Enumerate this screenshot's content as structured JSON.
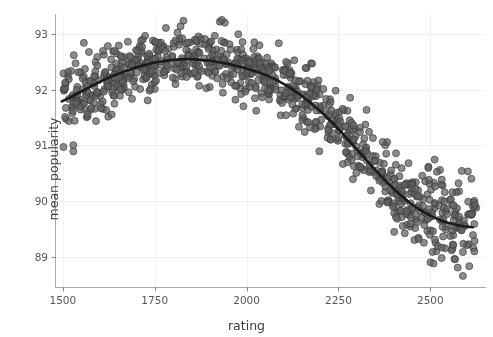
{
  "chart_data": {
    "type": "scatter",
    "title": "",
    "xlabel": "rating",
    "ylabel": "mean popularity",
    "xlim": [
      1480,
      2650
    ],
    "ylim": [
      88.45,
      93.35
    ],
    "xticks": [
      1500,
      1750,
      2000,
      2250,
      2500
    ],
    "yticks": [
      89,
      90,
      91,
      92,
      93
    ],
    "xtick_labels": [
      "1500",
      "1750",
      "2000",
      "2250",
      "2500"
    ],
    "ytick_labels": [
      "89",
      "90",
      "91",
      "92",
      "93"
    ],
    "grid": true,
    "grid_color": "#f0f0f0",
    "legend": "none",
    "point_color": "#5f5f5f",
    "point_edge_color": "#3a3a3a",
    "point_alpha": 0.72,
    "point_size": 7,
    "trend_color": "#1a1a1a",
    "trend_width": 2.6,
    "trend_note": "smoothed LOESS-style fit through the point cloud",
    "trend_points": [
      {
        "x": 1497,
        "y": 91.79
      },
      {
        "x": 1520,
        "y": 91.86
      },
      {
        "x": 1545,
        "y": 91.95
      },
      {
        "x": 1570,
        "y": 92.04
      },
      {
        "x": 1600,
        "y": 92.14
      },
      {
        "x": 1630,
        "y": 92.23
      },
      {
        "x": 1660,
        "y": 92.31
      },
      {
        "x": 1690,
        "y": 92.38
      },
      {
        "x": 1720,
        "y": 92.44
      },
      {
        "x": 1750,
        "y": 92.49
      },
      {
        "x": 1780,
        "y": 92.52
      },
      {
        "x": 1810,
        "y": 92.54
      },
      {
        "x": 1840,
        "y": 92.55
      },
      {
        "x": 1870,
        "y": 92.54
      },
      {
        "x": 1900,
        "y": 92.52
      },
      {
        "x": 1930,
        "y": 92.49
      },
      {
        "x": 1960,
        "y": 92.45
      },
      {
        "x": 1990,
        "y": 92.4
      },
      {
        "x": 2020,
        "y": 92.34
      },
      {
        "x": 2050,
        "y": 92.27
      },
      {
        "x": 2080,
        "y": 92.18
      },
      {
        "x": 2110,
        "y": 92.07
      },
      {
        "x": 2140,
        "y": 91.94
      },
      {
        "x": 2170,
        "y": 91.79
      },
      {
        "x": 2200,
        "y": 91.62
      },
      {
        "x": 2230,
        "y": 91.43
      },
      {
        "x": 2260,
        "y": 91.22
      },
      {
        "x": 2290,
        "y": 91.0
      },
      {
        "x": 2320,
        "y": 90.78
      },
      {
        "x": 2350,
        "y": 90.56
      },
      {
        "x": 2380,
        "y": 90.35
      },
      {
        "x": 2410,
        "y": 90.16
      },
      {
        "x": 2440,
        "y": 89.99
      },
      {
        "x": 2470,
        "y": 89.85
      },
      {
        "x": 2500,
        "y": 89.74
      },
      {
        "x": 2530,
        "y": 89.65
      },
      {
        "x": 2560,
        "y": 89.59
      },
      {
        "x": 2590,
        "y": 89.55
      },
      {
        "x": 2615,
        "y": 89.53
      }
    ],
    "scatter_description": "Dense cloud of ~900 semi-transparent dark-grey markers straddling the fitted curve; spread is widest near rating 2300-2620 where points fan from about 88.6 to 90.9, and tightest near rating 1700-1900 around 92.2-93.1.",
    "scatter_band": [
      {
        "x": 1500,
        "spread": 0.42
      },
      {
        "x": 1600,
        "spread": 0.3
      },
      {
        "x": 1750,
        "spread": 0.28
      },
      {
        "x": 1900,
        "spread": 0.26
      },
      {
        "x": 2050,
        "spread": 0.28
      },
      {
        "x": 2200,
        "spread": 0.3
      },
      {
        "x": 2350,
        "spread": 0.34
      },
      {
        "x": 2500,
        "spread": 0.42
      },
      {
        "x": 2620,
        "spread": 0.46
      }
    ]
  },
  "axes": {
    "xlabel": "rating",
    "ylabel": "mean popularity"
  }
}
